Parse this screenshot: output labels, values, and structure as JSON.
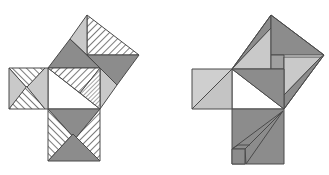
{
  "colors": {
    "dark": "#8c8c8c",
    "medium": "#a6a6a6",
    "light": "#c9c9c9",
    "white": "#ffffff",
    "hatch_line": "#5a5a5a",
    "stroke": "#4a4a4a"
  },
  "figures": [
    {
      "name": "left-figure",
      "description": "Dissection with hatched and shaded pieces on squares of legs and hypotenuse"
    },
    {
      "name": "right-figure",
      "description": "Shear-style dissection with shaded pieces and converging lines in leg square"
    }
  ]
}
